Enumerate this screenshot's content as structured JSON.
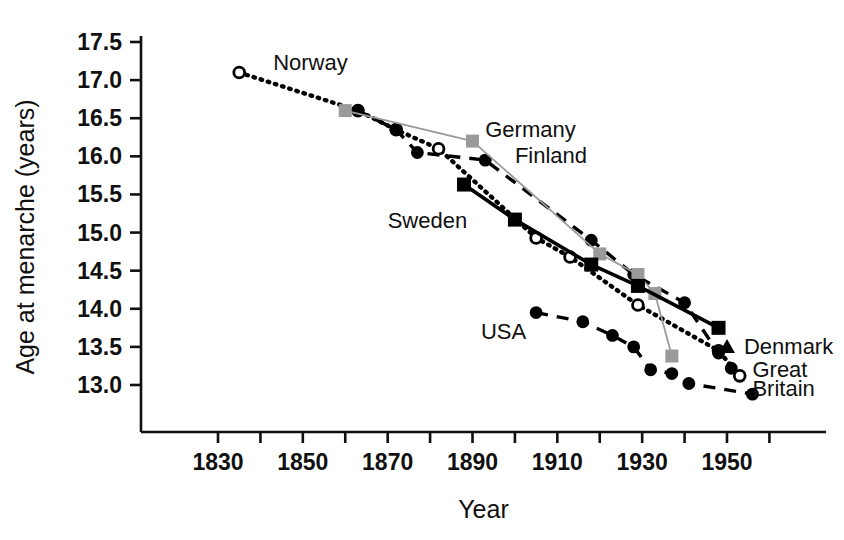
{
  "chart_data": {
    "type": "line",
    "title": "",
    "xlabel": "Year",
    "ylabel": "Age at menarche (years)",
    "xlim": [
      1825,
      1960
    ],
    "ylim": [
      12.6,
      17.6
    ],
    "grid": false,
    "legend_position": "inline-annotations",
    "x_ticks_major": [
      1830,
      1850,
      1870,
      1890,
      1910,
      1930,
      1950
    ],
    "x_ticks_minor": [
      1840,
      1860,
      1880,
      1900,
      1920,
      1940,
      1960
    ],
    "y_ticks": [
      13.0,
      13.5,
      14.0,
      14.5,
      15.0,
      15.5,
      16.0,
      16.5,
      17.0,
      17.5
    ],
    "x_tick_labels": [
      "1830",
      "1850",
      "1870",
      "1890",
      "1910",
      "1930",
      "1950"
    ],
    "y_tick_labels": [
      "13.0",
      "13.5",
      "14.0",
      "14.5",
      "15.0",
      "15.5",
      "16.0",
      "16.5",
      "17.0",
      "17.5"
    ],
    "series": [
      {
        "name": "Norway",
        "label": "Norway",
        "marker": "open-circle",
        "line": "dotted",
        "color": "#000000",
        "points": [
          {
            "x": 1835,
            "y": 17.1
          },
          {
            "x": 1863,
            "y": 16.6
          },
          {
            "x": 1872,
            "y": 16.35
          },
          {
            "x": 1882,
            "y": 16.1
          },
          {
            "x": 1905,
            "y": 14.93
          },
          {
            "x": 1913,
            "y": 14.68
          },
          {
            "x": 1929,
            "y": 14.05
          },
          {
            "x": 1948,
            "y": 13.45
          },
          {
            "x": 1953,
            "y": 13.12
          }
        ]
      },
      {
        "name": "Finland",
        "label": "Finland",
        "marker": "filled-circle",
        "line": "dashed",
        "color": "#000000",
        "points": [
          {
            "x": 1863,
            "y": 16.6
          },
          {
            "x": 1872,
            "y": 16.35
          },
          {
            "x": 1877,
            "y": 16.05
          },
          {
            "x": 1893,
            "y": 15.95
          },
          {
            "x": 1918,
            "y": 14.9
          },
          {
            "x": 1928,
            "y": 14.45
          },
          {
            "x": 1940,
            "y": 14.08
          },
          {
            "x": 1948,
            "y": 13.42
          },
          {
            "x": 1951,
            "y": 13.22
          }
        ]
      },
      {
        "name": "Germany",
        "label": "Germany",
        "marker": "gray-square",
        "line": "thin-gray",
        "color": "#9a9a9a",
        "points": [
          {
            "x": 1860,
            "y": 16.6
          },
          {
            "x": 1890,
            "y": 16.2
          },
          {
            "x": 1920,
            "y": 14.72
          },
          {
            "x": 1929,
            "y": 14.45
          },
          {
            "x": 1933,
            "y": 14.2
          },
          {
            "x": 1937,
            "y": 13.38
          }
        ]
      },
      {
        "name": "Sweden",
        "label": "Sweden",
        "marker": "filled-square",
        "line": "solid",
        "color": "#000000",
        "points": [
          {
            "x": 1888,
            "y": 15.63
          },
          {
            "x": 1900,
            "y": 15.17
          },
          {
            "x": 1918,
            "y": 14.58
          },
          {
            "x": 1929,
            "y": 14.3
          },
          {
            "x": 1948,
            "y": 13.75
          }
        ]
      },
      {
        "name": "USA / Great Britain",
        "label": "USA",
        "marker": "filled-circle",
        "line": "dashed",
        "color": "#000000",
        "points": [
          {
            "x": 1905,
            "y": 13.95
          },
          {
            "x": 1916,
            "y": 13.83
          },
          {
            "x": 1923,
            "y": 13.65
          },
          {
            "x": 1928,
            "y": 13.5
          },
          {
            "x": 1932,
            "y": 13.2
          },
          {
            "x": 1937,
            "y": 13.15
          },
          {
            "x": 1941,
            "y": 13.02
          },
          {
            "x": 1956,
            "y": 12.88
          }
        ]
      },
      {
        "name": "Denmark",
        "label": "Denmark",
        "marker": "filled-triangle",
        "line": "none",
        "color": "#000000",
        "points": [
          {
            "x": 1950,
            "y": 13.5
          }
        ]
      }
    ],
    "annotations": [
      {
        "text": "Norway",
        "x": 1843,
        "y": 17.22
      },
      {
        "text": "Germany",
        "x": 1893,
        "y": 16.35
      },
      {
        "text": "Finland",
        "x": 1900,
        "y": 16.0
      },
      {
        "text": "Sweden",
        "x": 1870,
        "y": 15.15
      },
      {
        "text": "USA",
        "x": 1892,
        "y": 13.7
      },
      {
        "text": "Denmark",
        "x": 1954,
        "y": 13.5
      },
      {
        "text": "Great",
        "x": 1956,
        "y": 13.2
      },
      {
        "text": "Britain",
        "x": 1956,
        "y": 12.95
      }
    ]
  }
}
